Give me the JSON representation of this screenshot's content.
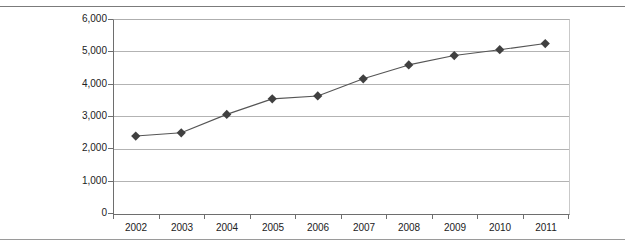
{
  "page": {
    "clipped_caption": "",
    "background_color": "#ffffff",
    "rule_color": "#8d8d8d"
  },
  "chart_data": {
    "type": "line",
    "title": "",
    "subtitle": "",
    "xlabel": "",
    "ylabel": "",
    "categories": [
      "2002",
      "2003",
      "2004",
      "2005",
      "2006",
      "2007",
      "2008",
      "2009",
      "2010",
      "2011"
    ],
    "values": [
      2380,
      2480,
      3050,
      3530,
      3620,
      4150,
      4580,
      4870,
      5050,
      5240
    ],
    "series": [
      {
        "name": "",
        "values": [
          2380,
          2480,
          3050,
          3530,
          3620,
          4150,
          4580,
          4870,
          5050,
          5240
        ]
      }
    ],
    "ylim": [
      0,
      6000
    ],
    "ytick_values": [
      0,
      1000,
      2000,
      3000,
      4000,
      5000,
      6000
    ],
    "ytick_labels": [
      "0",
      "1,000",
      "2,000",
      "3,000",
      "4,000",
      "5,000",
      "6,000"
    ],
    "grid": true,
    "grid_axis": "y",
    "legend": false,
    "legend_position": "none",
    "marker": "diamond",
    "marker_color": "#404040",
    "line_color": "#555555",
    "gridline_color": "#b3b3b3",
    "axis_color": "#6e6e6e",
    "annotations": []
  }
}
